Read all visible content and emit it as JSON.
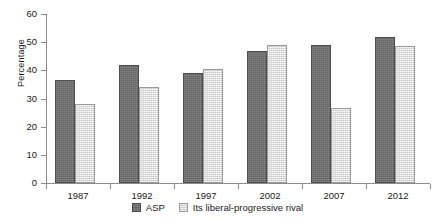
{
  "chart_data": {
    "type": "bar",
    "title": "",
    "xlabel": "",
    "ylabel": "Percentage",
    "categories": [
      "1987",
      "1992",
      "1997",
      "2002",
      "2007",
      "2012"
    ],
    "series": [
      {
        "name": "ASP",
        "color": "#6f6f6f",
        "values": [
          36.5,
          42,
          39,
          47,
          49,
          52
        ]
      },
      {
        "name": "Its liberal-progressive rival",
        "color": "#dcdcdc",
        "values": [
          28,
          34,
          40.5,
          49,
          26.5,
          48.5
        ]
      }
    ],
    "ylim": [
      0,
      60
    ],
    "yticks": [
      0,
      10,
      20,
      30,
      40,
      50,
      60
    ],
    "ytick_labels": [
      "0",
      "10",
      "20",
      "30",
      "40",
      "50",
      "60"
    ],
    "grid": false,
    "legend_position": "bottom-center"
  },
  "legend": {
    "items": [
      {
        "label": "ASP"
      },
      {
        "label": "Its liberal-progressive rival"
      }
    ]
  }
}
